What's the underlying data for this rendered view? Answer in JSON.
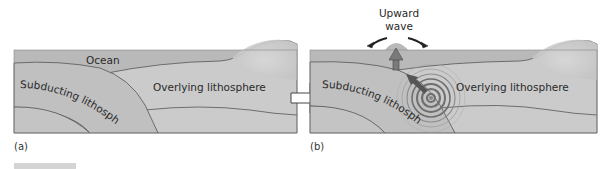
{
  "panels": [
    {
      "id": "a",
      "caption": "(a)",
      "labels": {
        "ocean": "Ocean",
        "subducting": "Subducting lithosphere",
        "overlying": "Overlying lithosphere"
      }
    },
    {
      "id": "b",
      "caption": "(b)",
      "labels": {
        "wave_line1": "Upward",
        "wave_line2": "wave",
        "subducting": "Subducting lithosphere",
        "overlying": "Overlying lithosphere"
      }
    }
  ],
  "transition_arrow": "right-arrow",
  "colors": {
    "ocean": "#b9b9b9",
    "lithosphere": "#c9c9c9",
    "slab": "#bdbdbd",
    "lower": "#c3c3c3",
    "outline": "#555555",
    "rings": "#6e6e6e",
    "arrow": "#7a7a7a"
  }
}
